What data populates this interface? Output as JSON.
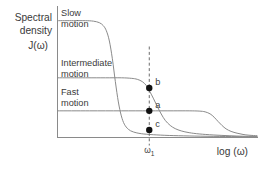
{
  "figure": {
    "background_color": "#ffffff",
    "axis_color": "#8a8a8a",
    "curve_color": "#8a8a8a",
    "dot_color": "#111111",
    "text_color": "#3a3a3a"
  },
  "labels": {
    "y_axis_line1": "Spectral",
    "y_axis_line2": "density",
    "y_axis_line3": "J(ω)",
    "x_axis": "log (ω)",
    "tick_omega": "ω",
    "tick_omega_sub": "1",
    "region_slow_line1": "Slow",
    "region_slow_line2": "motion",
    "region_intermediate_line1": "Intermediate",
    "region_intermediate_line2": "motion",
    "region_fast_line1": "Fast",
    "region_fast_line2": "motion",
    "point_b": "b",
    "point_a": "a",
    "point_c": "c"
  },
  "chart_data": {
    "type": "line",
    "title": "",
    "xlabel": "log (ω)",
    "ylabel": "Spectral density J(ω)",
    "xlim": [
      0,
      100
    ],
    "ylim": [
      0,
      100
    ],
    "grid": false,
    "legend": "inline-annotations",
    "axis_ticks_numeric": false,
    "annotations": [
      {
        "name": "slow-motion-label",
        "text": "Slow motion",
        "x": 12,
        "y": 96
      },
      {
        "name": "intermediate-motion-label",
        "text": "Intermediate motion",
        "x": 12,
        "y": 58
      },
      {
        "name": "fast-motion-label",
        "text": "Fast motion",
        "x": 12,
        "y": 32
      },
      {
        "name": "omega-1-marker",
        "text": "ω₁",
        "x": 46,
        "y": 0
      }
    ],
    "vertical_marker": {
      "name": "omega-1",
      "x": 46,
      "label": "ω₁"
    },
    "markers": [
      {
        "label": "b",
        "x": 46,
        "y": 39,
        "series": "Slow motion",
        "description": "J at ω₁ for slow motion (long correlation time)"
      },
      {
        "label": "a",
        "x": 46,
        "y": 21,
        "series": "Intermediate motion",
        "description": "J at ω₁ for intermediate motion"
      },
      {
        "label": "c",
        "x": 46,
        "y": 6,
        "series": "Fast motion",
        "description": "J at ω₁ for fast motion (short correlation time)"
      }
    ],
    "series": [
      {
        "name": "Slow motion",
        "plateau_value": 92,
        "corner_x": 26,
        "description": "Highest low-frequency plateau, earliest roll-off (longest correlation time)",
        "points": [
          [
            0,
            92
          ],
          [
            8,
            92
          ],
          [
            14,
            92
          ],
          [
            18,
            91.6
          ],
          [
            21,
            90.4
          ],
          [
            23,
            88
          ],
          [
            24.5,
            84
          ],
          [
            26,
            76
          ],
          [
            27.5,
            62
          ],
          [
            29,
            44
          ],
          [
            30.5,
            28
          ],
          [
            32,
            17
          ],
          [
            33.5,
            10.5
          ],
          [
            35.5,
            6.5
          ],
          [
            38,
            4.4
          ],
          [
            42,
            3.0
          ],
          [
            48,
            2.2
          ],
          [
            56,
            1.6
          ],
          [
            66,
            1.2
          ],
          [
            78,
            0.9
          ],
          [
            90,
            0.7
          ],
          [
            100,
            0.6
          ]
        ]
      },
      {
        "name": "Intermediate motion",
        "plateau_value": 47,
        "corner_x": 42,
        "description": "Mid-level plateau crossing ω₁ near its roll-off shoulder",
        "points": [
          [
            0,
            47
          ],
          [
            14,
            47
          ],
          [
            24,
            47
          ],
          [
            32,
            47
          ],
          [
            37,
            46.6
          ],
          [
            40,
            45.8
          ],
          [
            42.5,
            44
          ],
          [
            44.5,
            41
          ],
          [
            46,
            37
          ],
          [
            48,
            31
          ],
          [
            50,
            24.5
          ],
          [
            52,
            18.5
          ],
          [
            54,
            13.5
          ],
          [
            56.5,
            9.5
          ],
          [
            59,
            7
          ],
          [
            62,
            5.2
          ],
          [
            66,
            3.8
          ],
          [
            71,
            2.8
          ],
          [
            78,
            2.0
          ],
          [
            86,
            1.4
          ],
          [
            93,
            1.0
          ],
          [
            100,
            0.8
          ]
        ]
      },
      {
        "name": "Fast motion",
        "plateau_value": 21,
        "corner_x": 76,
        "description": "Lowest plateau, extends furthest before roll-off (shortest correlation time)",
        "points": [
          [
            0,
            21
          ],
          [
            16,
            21
          ],
          [
            32,
            21
          ],
          [
            46,
            21
          ],
          [
            58,
            21
          ],
          [
            66,
            21
          ],
          [
            71,
            20.8
          ],
          [
            74,
            20.2
          ],
          [
            76.5,
            18.6
          ],
          [
            78.5,
            16
          ],
          [
            80.5,
            12.6
          ],
          [
            82.5,
            9.4
          ],
          [
            84.5,
            6.8
          ],
          [
            87,
            4.8
          ],
          [
            90,
            3.4
          ],
          [
            93,
            2.4
          ],
          [
            96,
            1.8
          ],
          [
            100,
            1.4
          ]
        ]
      }
    ]
  }
}
